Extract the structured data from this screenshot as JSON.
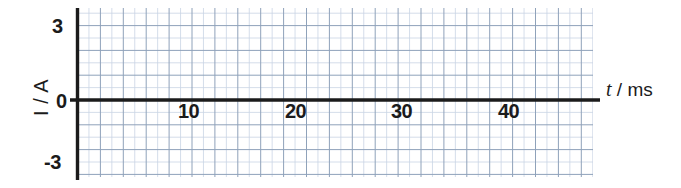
{
  "chart_data": {
    "type": "line",
    "title": "",
    "subtitle": "",
    "xlabel": "t / ms",
    "ylabel": "I / A",
    "xlabel_symbol": "t",
    "xlabel_unit": "/ ms",
    "xlim": [
      0,
      45.5
    ],
    "ylim": [
      -3.6,
      3.6
    ],
    "grid": true,
    "legend": null,
    "annotations": [],
    "x_ticks": [
      10,
      20,
      30,
      40
    ],
    "x_tick_labels": [
      "10",
      "20",
      "30",
      "40"
    ],
    "y_ticks": [
      3,
      0,
      -3
    ],
    "y_tick_labels": [
      "3",
      "0",
      "-3"
    ],
    "x_minor_step": 1,
    "y_minor_step": 0.5,
    "x_major_step": 2,
    "y_major_step": 1,
    "series": [
      {
        "name": "current",
        "form": "sine",
        "amplitude": 3,
        "period_ms": 20,
        "phase_deg": 0,
        "equation": "I = 3 sin(2πt / 20)",
        "x": [
          0,
          1,
          2,
          3,
          4,
          5,
          6,
          7,
          8,
          9,
          10,
          11,
          12,
          13,
          14,
          15,
          16,
          17,
          18,
          19,
          20,
          21,
          22,
          23,
          24,
          25,
          26,
          27,
          28,
          29,
          30,
          31,
          32,
          33,
          34,
          35,
          36,
          37,
          38,
          39,
          40,
          41,
          42,
          43,
          44,
          45
        ],
        "values": [
          0,
          0.93,
          1.76,
          2.43,
          2.85,
          3,
          2.85,
          2.43,
          1.76,
          0.93,
          0,
          -0.93,
          -1.76,
          -2.43,
          -2.85,
          -3,
          -2.85,
          -2.43,
          -1.76,
          -0.93,
          0,
          0.93,
          1.76,
          2.43,
          2.85,
          3,
          2.85,
          2.43,
          1.76,
          0.93,
          0,
          -0.93,
          -1.76,
          -2.43,
          -2.85,
          -3,
          -2.85,
          -2.43,
          -1.76,
          -0.93,
          0,
          0.93,
          1.76,
          2.43,
          2.85,
          3
        ]
      }
    ]
  },
  "colors": {
    "curve": "#5b7286",
    "axis": "#1b1b1b",
    "grid_minor": "#c9d4e4",
    "grid_major": "#93a4bb",
    "background": "#ffffff",
    "text": "#1b1b1b"
  },
  "axes": {
    "y_label": "I / A",
    "x_label_symbol": "t",
    "x_label_rest": "/ ms",
    "y_tick_top": "3",
    "y_tick_zero": "0",
    "y_tick_bottom": "-3",
    "x_tick_1": "10",
    "x_tick_2": "20",
    "x_tick_3": "30",
    "x_tick_4": "40"
  }
}
